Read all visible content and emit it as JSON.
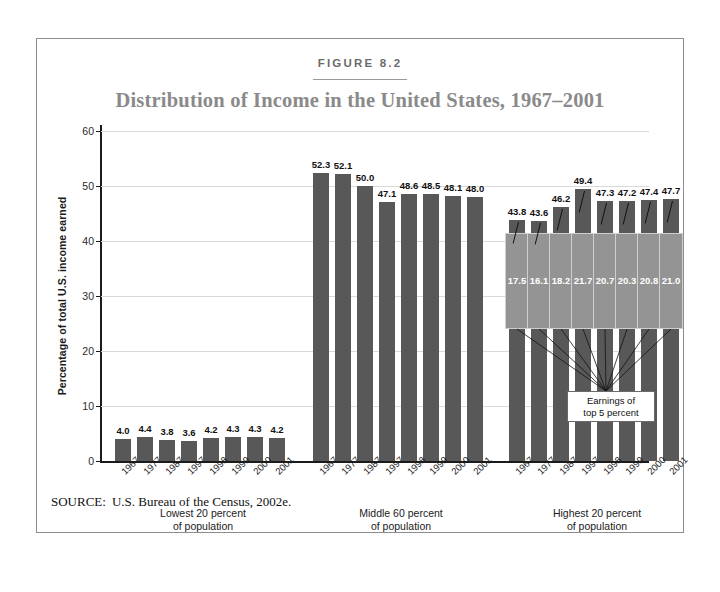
{
  "figure": {
    "label": "FIGURE 8.2",
    "title": "Distribution of Income in the United States, 1967–2001",
    "source_label": "SOURCE:",
    "source_text": "U.S. Bureau of the Census, 2002e."
  },
  "annotation": {
    "line1": "Earnings of",
    "line2": "top 5 percent"
  },
  "colors": {
    "bar": "#585858",
    "overlay": "#949494",
    "gridline": "#d9d9d9",
    "axis": "#1b1b1b",
    "title": "#8a8a8a",
    "frame": "#8d8d8d"
  },
  "chart_data": {
    "type": "bar",
    "title": "Distribution of Income in the United States, 1967–2001",
    "xlabel": "",
    "ylabel": "Percentage of total U.S. income earned",
    "ylim": [
      0,
      60
    ],
    "yticks": [
      0,
      10,
      20,
      30,
      40,
      50,
      60
    ],
    "ytick_labels": [
      "0",
      "10",
      "20",
      "30",
      "40",
      "50",
      "60"
    ],
    "grid": true,
    "legend": "none",
    "categories": [
      "1967",
      "1977",
      "1987",
      "1997",
      "1998",
      "1999",
      "2000",
      "2001"
    ],
    "groups": [
      {
        "name": "Lowest 20 percent of population",
        "caption_line1": "Lowest 20 percent",
        "caption_line2": "of population",
        "values": [
          4.0,
          4.4,
          3.8,
          3.6,
          4.2,
          4.3,
          4.3,
          4.2
        ],
        "labels": [
          "4.0",
          "4.4",
          "3.8",
          "3.6",
          "4.2",
          "4.3",
          "4.3",
          "4.2"
        ]
      },
      {
        "name": "Middle 60 percent of population",
        "caption_line1": "Middle 60 percent",
        "caption_line2": "of population",
        "values": [
          52.3,
          52.1,
          50.0,
          47.1,
          48.6,
          48.5,
          48.1,
          48.0
        ],
        "labels": [
          "52.3",
          "52.1",
          "50.0",
          "47.1",
          "48.6",
          "48.5",
          "48.1",
          "48.0"
        ]
      },
      {
        "name": "Highest 20 percent of population",
        "caption_line1": "Highest 20 percent",
        "caption_line2": "of population",
        "values": [
          43.8,
          43.6,
          46.2,
          49.4,
          47.3,
          47.2,
          47.4,
          47.7
        ],
        "labels": [
          "43.8",
          "43.6",
          "46.2",
          "49.4",
          "47.3",
          "47.2",
          "47.4",
          "47.7"
        ],
        "overlay_name": "Earnings of top 5 percent",
        "overlay_values": [
          17.5,
          16.1,
          18.2,
          21.7,
          20.7,
          20.3,
          20.8,
          21.0
        ],
        "overlay_labels": [
          "17.5",
          "16.1",
          "18.2",
          "21.7",
          "20.7",
          "20.3",
          "20.8",
          "21.0"
        ],
        "overlay_top": 41.5,
        "overlay_bottom": 24.0
      }
    ]
  }
}
